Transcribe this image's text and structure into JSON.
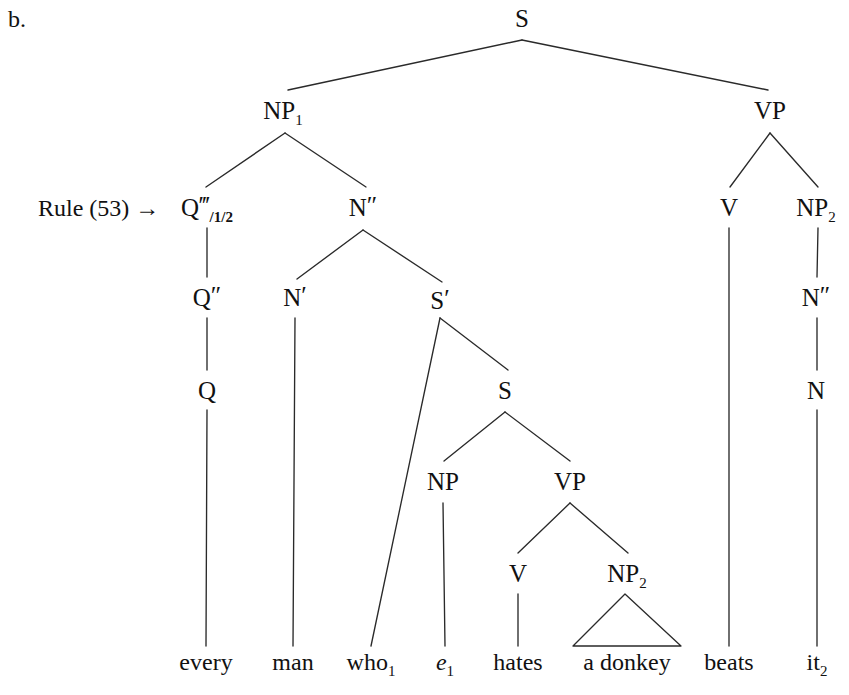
{
  "figure": {
    "item_letter": "b.",
    "annotation": {
      "text": "Rule (53) →",
      "target_node": "Q‴/1/2"
    },
    "ink_color": "#1a1a1a",
    "background_color": "#ffffff"
  },
  "tree": {
    "type": "syntax-tree",
    "sentence": "every man who1 e1 hates a donkey beats it2",
    "nodes": [
      {
        "id": "S",
        "label": "S",
        "sub": "",
        "primes": "",
        "x": 522,
        "y": 18
      },
      {
        "id": "NP1",
        "label": "NP",
        "sub": "1",
        "primes": "",
        "x": 283,
        "y": 110
      },
      {
        "id": "VP_top",
        "label": "VP",
        "sub": "",
        "primes": "",
        "x": 770,
        "y": 110
      },
      {
        "id": "Q3",
        "label": "Q",
        "sub": "",
        "primes": "‴",
        "slashsub": "/1/2",
        "x": 207,
        "y": 207
      },
      {
        "id": "N2",
        "label": "N",
        "sub": "",
        "primes": "″",
        "x": 363,
        "y": 207
      },
      {
        "id": "V_top",
        "label": "V",
        "sub": "",
        "primes": "",
        "x": 729,
        "y": 207
      },
      {
        "id": "NP2_r",
        "label": "NP",
        "sub": "2",
        "primes": "",
        "x": 816,
        "y": 207
      },
      {
        "id": "Q2",
        "label": "Q",
        "sub": "",
        "primes": "″",
        "x": 207,
        "y": 297
      },
      {
        "id": "N1",
        "label": "N",
        "sub": "",
        "primes": "′",
        "x": 295,
        "y": 297
      },
      {
        "id": "Sbar",
        "label": "S",
        "sub": "",
        "primes": "′",
        "x": 440,
        "y": 300
      },
      {
        "id": "N2_r",
        "label": "N",
        "sub": "",
        "primes": "″",
        "x": 816,
        "y": 297
      },
      {
        "id": "Q0",
        "label": "Q",
        "sub": "",
        "primes": "",
        "x": 207,
        "y": 390
      },
      {
        "id": "S_emb",
        "label": "S",
        "sub": "",
        "primes": "",
        "x": 505,
        "y": 390
      },
      {
        "id": "N_r",
        "label": "N",
        "sub": "",
        "primes": "",
        "x": 816,
        "y": 390
      },
      {
        "id": "NP_emb",
        "label": "NP",
        "sub": "",
        "primes": "",
        "x": 443,
        "y": 481
      },
      {
        "id": "VP_emb",
        "label": "VP",
        "sub": "",
        "primes": "",
        "x": 570,
        "y": 481
      },
      {
        "id": "V_emb",
        "label": "V",
        "sub": "",
        "primes": "",
        "x": 518,
        "y": 573
      },
      {
        "id": "NP2_emb",
        "label": "NP",
        "sub": "2",
        "primes": "",
        "x": 627,
        "y": 573
      }
    ],
    "edges": [
      {
        "from": "S",
        "to": "NP1",
        "x1": 522,
        "y1": 40,
        "x2": 288,
        "y2": 90
      },
      {
        "from": "S",
        "to": "VP_top",
        "x1": 522,
        "y1": 40,
        "x2": 768,
        "y2": 90
      },
      {
        "from": "NP1",
        "to": "Q3",
        "x1": 285,
        "y1": 133,
        "x2": 206,
        "y2": 187
      },
      {
        "from": "NP1",
        "to": "N2",
        "x1": 285,
        "y1": 133,
        "x2": 366,
        "y2": 187
      },
      {
        "from": "Q3",
        "to": "Q2",
        "x1": 207,
        "y1": 228,
        "x2": 207,
        "y2": 277
      },
      {
        "from": "N2",
        "to": "N1",
        "x1": 363,
        "y1": 230,
        "x2": 297,
        "y2": 279
      },
      {
        "from": "N2",
        "to": "Sbar",
        "x1": 363,
        "y1": 230,
        "x2": 442,
        "y2": 282
      },
      {
        "from": "Q2",
        "to": "Q0",
        "x1": 207,
        "y1": 318,
        "x2": 207,
        "y2": 370
      },
      {
        "from": "N1",
        "to": "man",
        "x1": 295,
        "y1": 318,
        "x2": 293,
        "y2": 646
      },
      {
        "from": "Sbar",
        "to": "who",
        "x1": 440,
        "y1": 318,
        "x2": 371,
        "y2": 646
      },
      {
        "from": "Sbar",
        "to": "S_emb",
        "x1": 440,
        "y1": 318,
        "x2": 508,
        "y2": 370
      },
      {
        "from": "Q0",
        "to": "every",
        "x1": 207,
        "y1": 410,
        "x2": 206,
        "y2": 646
      },
      {
        "from": "S_emb",
        "to": "NP_emb",
        "x1": 505,
        "y1": 412,
        "x2": 444,
        "y2": 461
      },
      {
        "from": "S_emb",
        "to": "VP_emb",
        "x1": 505,
        "y1": 412,
        "x2": 570,
        "y2": 461
      },
      {
        "from": "NP_emb",
        "to": "e1",
        "x1": 443,
        "y1": 503,
        "x2": 445,
        "y2": 646
      },
      {
        "from": "VP_emb",
        "to": "V_emb",
        "x1": 570,
        "y1": 503,
        "x2": 518,
        "y2": 553
      },
      {
        "from": "VP_emb",
        "to": "NP2_emb",
        "x1": 570,
        "y1": 503,
        "x2": 628,
        "y2": 553
      },
      {
        "from": "V_emb",
        "to": "hates",
        "x1": 518,
        "y1": 594,
        "x2": 518,
        "y2": 646
      },
      {
        "from": "VP_top",
        "to": "V_top",
        "x1": 770,
        "y1": 133,
        "x2": 730,
        "y2": 187
      },
      {
        "from": "VP_top",
        "to": "NP2_r",
        "x1": 770,
        "y1": 133,
        "x2": 818,
        "y2": 187
      },
      {
        "from": "V_top",
        "to": "beats",
        "x1": 729,
        "y1": 228,
        "x2": 729,
        "y2": 646
      },
      {
        "from": "NP2_r",
        "to": "N2_r",
        "x1": 818,
        "y1": 228,
        "x2": 817,
        "y2": 277
      },
      {
        "from": "N2_r",
        "to": "N_r",
        "x1": 817,
        "y1": 318,
        "x2": 817,
        "y2": 370
      },
      {
        "from": "N_r",
        "to": "it2",
        "x1": 817,
        "y1": 410,
        "x2": 817,
        "y2": 646
      }
    ],
    "triangle": {
      "parent": "NP2_emb",
      "apex_x": 625,
      "apex_y": 594,
      "left_x": 573,
      "right_x": 681,
      "base_y": 646
    },
    "terminals": [
      {
        "id": "every",
        "text": "every",
        "sub": "",
        "italic": false,
        "x": 206,
        "y": 670
      },
      {
        "id": "man",
        "text": "man",
        "sub": "",
        "italic": false,
        "x": 293,
        "y": 670
      },
      {
        "id": "who",
        "text": "who",
        "sub": "1",
        "italic": false,
        "x": 371,
        "y": 670
      },
      {
        "id": "e1",
        "text": "e",
        "sub": "1",
        "italic": true,
        "x": 445,
        "y": 670
      },
      {
        "id": "hates",
        "text": "hates",
        "sub": "",
        "italic": false,
        "x": 518,
        "y": 670
      },
      {
        "id": "donkey",
        "text": "a donkey",
        "sub": "",
        "italic": false,
        "x": 627,
        "y": 670
      },
      {
        "id": "beats",
        "text": "beats",
        "sub": "",
        "italic": false,
        "x": 729,
        "y": 670
      },
      {
        "id": "it2",
        "text": "it",
        "sub": "2",
        "italic": false,
        "x": 817,
        "y": 670
      }
    ]
  }
}
